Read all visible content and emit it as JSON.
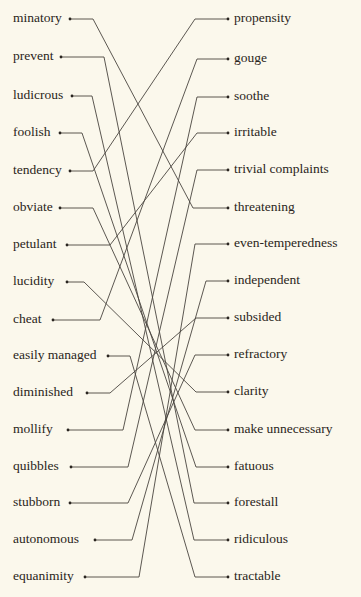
{
  "colors": {
    "background": "#fbf8ec",
    "text": "#2a2520",
    "line": "#4a4540"
  },
  "left_terms": [
    {
      "label": "minatory",
      "y": 19,
      "dot_x": 70,
      "bend_x": 93
    },
    {
      "label": "prevent",
      "y": 57,
      "dot_x": 61,
      "bend_x": 104
    },
    {
      "label": "ludicrous",
      "y": 96,
      "dot_x": 72,
      "bend_x": 92
    },
    {
      "label": "foolish",
      "y": 133,
      "dot_x": 60,
      "bend_x": 82
    },
    {
      "label": "tendency",
      "y": 171,
      "dot_x": 70,
      "bend_x": 93
    },
    {
      "label": "obviate",
      "y": 208,
      "dot_x": 60,
      "bend_x": 93
    },
    {
      "label": "petulant",
      "y": 245,
      "dot_x": 67,
      "bend_x": 110
    },
    {
      "label": "lucidity",
      "y": 282,
      "dot_x": 67,
      "bend_x": 84
    },
    {
      "label": "cheat",
      "y": 320,
      "dot_x": 53,
      "bend_x": 100
    },
    {
      "label": "easily managed",
      "y": 356,
      "dot_x": 108,
      "bend_x": 130
    },
    {
      "label": "diminished",
      "y": 393,
      "dot_x": 87,
      "bend_x": 110
    },
    {
      "label": "mollify",
      "y": 430,
      "dot_x": 68,
      "bend_x": 123
    },
    {
      "label": "quibbles",
      "y": 467,
      "dot_x": 71,
      "bend_x": 128
    },
    {
      "label": "stubborn",
      "y": 503,
      "dot_x": 70,
      "bend_x": 128
    },
    {
      "label": "autonomous",
      "y": 540,
      "dot_x": 95,
      "bend_x": 132
    },
    {
      "label": "equanimity",
      "y": 577,
      "dot_x": 85,
      "bend_x": 139
    }
  ],
  "right_terms": [
    {
      "label": "propensity",
      "y": 19,
      "dot_x": 228,
      "bend_x": 195
    },
    {
      "label": "gouge",
      "y": 59,
      "dot_x": 228,
      "bend_x": 197
    },
    {
      "label": "soothe",
      "y": 97,
      "dot_x": 228,
      "bend_x": 197
    },
    {
      "label": "irritable",
      "y": 133,
      "dot_x": 228,
      "bend_x": 197
    },
    {
      "label": "trivial complaints",
      "y": 170,
      "dot_x": 228,
      "bend_x": 197
    },
    {
      "label": "threatening",
      "y": 208,
      "dot_x": 228,
      "bend_x": 193
    },
    {
      "label": "even-temperedness",
      "y": 244,
      "dot_x": 228,
      "bend_x": 195
    },
    {
      "label": "independent",
      "y": 281,
      "dot_x": 228,
      "bend_x": 206
    },
    {
      "label": "subsided",
      "y": 318,
      "dot_x": 228,
      "bend_x": 196
    },
    {
      "label": "refractory",
      "y": 355,
      "dot_x": 228,
      "bend_x": 195
    },
    {
      "label": "clarity",
      "y": 392,
      "dot_x": 228,
      "bend_x": 196
    },
    {
      "label": "make unnecessary",
      "y": 430,
      "dot_x": 228,
      "bend_x": 195
    },
    {
      "label": "fatuous",
      "y": 467,
      "dot_x": 228,
      "bend_x": 196
    },
    {
      "label": "forestall",
      "y": 503,
      "dot_x": 228,
      "bend_x": 194
    },
    {
      "label": "ridiculous",
      "y": 540,
      "dot_x": 228,
      "bend_x": 194
    },
    {
      "label": "tractable",
      "y": 577,
      "dot_x": 228,
      "bend_x": 195
    }
  ],
  "matches": [
    {
      "left": "minatory",
      "right": "threatening"
    },
    {
      "left": "prevent",
      "right": "forestall"
    },
    {
      "left": "ludicrous",
      "right": "ridiculous"
    },
    {
      "left": "foolish",
      "right": "fatuous"
    },
    {
      "left": "tendency",
      "right": "propensity"
    },
    {
      "left": "obviate",
      "right": "make unnecessary"
    },
    {
      "left": "petulant",
      "right": "irritable"
    },
    {
      "left": "lucidity",
      "right": "clarity"
    },
    {
      "left": "cheat",
      "right": "gouge"
    },
    {
      "left": "easily managed",
      "right": "tractable"
    },
    {
      "left": "diminished",
      "right": "subsided"
    },
    {
      "left": "mollify",
      "right": "soothe"
    },
    {
      "left": "quibbles",
      "right": "trivial complaints"
    },
    {
      "left": "stubborn",
      "right": "refractory"
    },
    {
      "left": "autonomous",
      "right": "independent"
    },
    {
      "left": "equanimity",
      "right": "even-temperedness"
    }
  ]
}
